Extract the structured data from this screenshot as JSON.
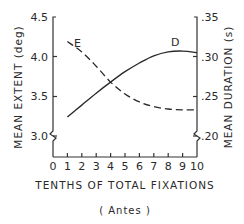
{
  "chart_data": {
    "type": "line",
    "title": "",
    "caption": "( Antes )",
    "xlabel": "TENTHS OF TOTAL FIXATIONS",
    "ylabel_left": "MEAN EXTENT (deg)",
    "ylabel_right": "MEAN DURATION (s)",
    "x": [
      1,
      2,
      3,
      4,
      5,
      6,
      7,
      8,
      9,
      10
    ],
    "xlim": [
      0,
      10
    ],
    "x_ticks": [
      "0",
      "1",
      "2",
      "3",
      "4",
      "5",
      "6",
      "7",
      "8",
      "9",
      "10"
    ],
    "ylim_left": [
      3.0,
      4.5
    ],
    "y_ticks_left": [
      "3.0",
      "3.5",
      "4.0",
      "4.5"
    ],
    "ylim_right": [
      0.2,
      0.35
    ],
    "y_ticks_right": [
      ".20",
      ".25",
      ".30",
      ".35"
    ],
    "axis_breaks": true,
    "grid": false,
    "legend": "inline labels on curves",
    "series": [
      {
        "name": "E",
        "meaning": "Mean extent",
        "axis": "left",
        "style": "dashed",
        "values": [
          4.19,
          4.06,
          3.88,
          3.68,
          3.53,
          3.43,
          3.37,
          3.34,
          3.33,
          3.33
        ]
      },
      {
        "name": "D",
        "meaning": "Mean duration",
        "axis": "right",
        "style": "solid",
        "values": [
          0.224,
          0.239,
          0.254,
          0.268,
          0.281,
          0.292,
          0.301,
          0.306,
          0.307,
          0.305
        ]
      }
    ]
  },
  "labels": {
    "series_e": "E",
    "series_d": "D",
    "xlabel": "TENTHS OF TOTAL FIXATIONS",
    "ylabel_left": "MEAN EXTENT (deg)",
    "ylabel_right": "MEAN DURATION (s)",
    "caption": "( Antes )"
  }
}
